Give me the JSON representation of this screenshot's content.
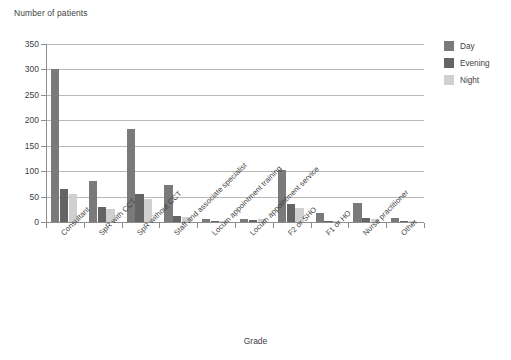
{
  "chart_data": {
    "type": "bar",
    "title": "",
    "ylabel": "Number of patients",
    "xlabel": "Grade",
    "ylim": [
      0,
      350
    ],
    "yticks": [
      0,
      50,
      100,
      150,
      200,
      250,
      300,
      350
    ],
    "grid": true,
    "legend_position": "right",
    "categories": [
      "Consultant",
      "SpR with CCT",
      "SpR without CCT",
      "Staff and associate specialist",
      "Locum appointment training",
      "Locum appointment service",
      "F2 or SHO",
      "F1 or HO",
      "Nurse practitioner",
      "Other"
    ],
    "series": [
      {
        "name": "Day",
        "color": "#7a7a7a",
        "values": [
          300,
          80,
          183,
          72,
          5,
          6,
          102,
          18,
          37,
          8
        ]
      },
      {
        "name": "Evening",
        "color": "#646464",
        "values": [
          65,
          30,
          55,
          12,
          2,
          4,
          35,
          1,
          8,
          1
        ]
      },
      {
        "name": "Night",
        "color": "#d0d0d0",
        "values": [
          55,
          25,
          45,
          10,
          1,
          5,
          28,
          1,
          6,
          1
        ]
      }
    ]
  },
  "axis": {
    "y_title": "Number of patients",
    "x_title": "Grade",
    "y_tick_labels": [
      "0",
      "50",
      "100",
      "150",
      "200",
      "250",
      "300",
      "350"
    ]
  },
  "legend": {
    "items": [
      {
        "label": "Day"
      },
      {
        "label": "Evening"
      },
      {
        "label": "Night"
      }
    ]
  }
}
